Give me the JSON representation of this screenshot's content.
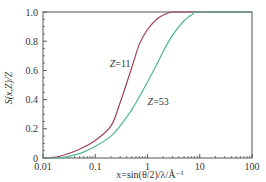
{
  "chart_data": {
    "type": "line",
    "title": "",
    "xlabel": "x=sin(θ/2)/λ/Å⁻¹",
    "ylabel": "S(x,Z)/Z",
    "xscale": "log",
    "xlim": [
      0.01,
      100
    ],
    "ylim": [
      0,
      1.0
    ],
    "x_ticks": [
      "0.01",
      "0.1",
      "1",
      "10",
      "100"
    ],
    "y_ticks": [
      "0",
      "0.2",
      "0.4",
      "0.6",
      "0.8",
      "1.0"
    ],
    "grid": false,
    "legend": null,
    "annotations": [
      {
        "text": "Z=11",
        "x": 0.3,
        "y": 0.62
      },
      {
        "text": "Z=53",
        "x": 1.6,
        "y": 0.36
      }
    ],
    "series": [
      {
        "name": "Z=11",
        "color": "#a0405e",
        "x": [
          0.01,
          0.02,
          0.05,
          0.1,
          0.2,
          0.3,
          0.5,
          0.7,
          1.0,
          1.5,
          2.0,
          3.0,
          5.0,
          10,
          100
        ],
        "y": [
          0.0,
          0.01,
          0.06,
          0.12,
          0.22,
          0.38,
          0.62,
          0.78,
          0.88,
          0.95,
          0.98,
          1.0,
          1.0,
          1.0,
          1.0
        ]
      },
      {
        "name": "Z=53",
        "color": "#4db890",
        "x": [
          0.01,
          0.02,
          0.05,
          0.1,
          0.2,
          0.3,
          0.5,
          0.7,
          1.0,
          1.5,
          2.0,
          3.0,
          5.0,
          7.0,
          10,
          100
        ],
        "y": [
          0.0,
          0.0,
          0.03,
          0.08,
          0.15,
          0.22,
          0.33,
          0.42,
          0.52,
          0.64,
          0.73,
          0.84,
          0.94,
          0.98,
          1.0,
          1.0
        ]
      }
    ]
  }
}
